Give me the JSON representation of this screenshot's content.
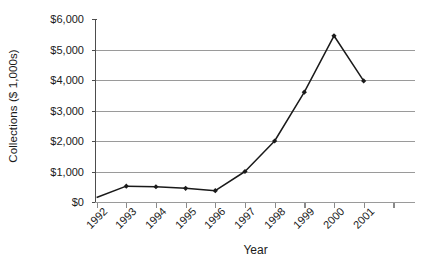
{
  "chart_data": {
    "type": "line",
    "title": "",
    "xlabel": "Year",
    "ylabel": "Collections ($ 1,000s)",
    "categories": [
      "1992",
      "1993",
      "1994",
      "1995",
      "1996",
      "1997",
      "1998",
      "1999",
      "2000",
      "2001"
    ],
    "values": [
      150,
      520,
      500,
      450,
      370,
      1000,
      2000,
      3600,
      5450,
      3970
    ],
    "series": [
      {
        "name": "Collections",
        "values": [
          150,
          520,
          500,
          450,
          370,
          1000,
          2000,
          3600,
          5450,
          3970
        ]
      }
    ],
    "ylim": [
      0,
      6000
    ],
    "ytick_values": [
      0,
      1000,
      2000,
      3000,
      4000,
      5000,
      6000
    ],
    "ytick_labels": [
      "$0",
      "$1,000",
      "$2,000",
      "$3,000",
      "$4,000",
      "$5,000",
      "$6,000"
    ],
    "gridlines_at": [
      1000,
      2000,
      3000,
      4000,
      5000
    ],
    "grid": true,
    "legend": false,
    "legend_position": "none",
    "marker": "diamond",
    "line_color": "#1a1a1a",
    "marker_color": "#1a1a1a",
    "grid_color": "#9a9a9a",
    "axis_color": "#4d4d4d",
    "background_color": "#ffffff",
    "xtick_label_rotation": -45
  }
}
